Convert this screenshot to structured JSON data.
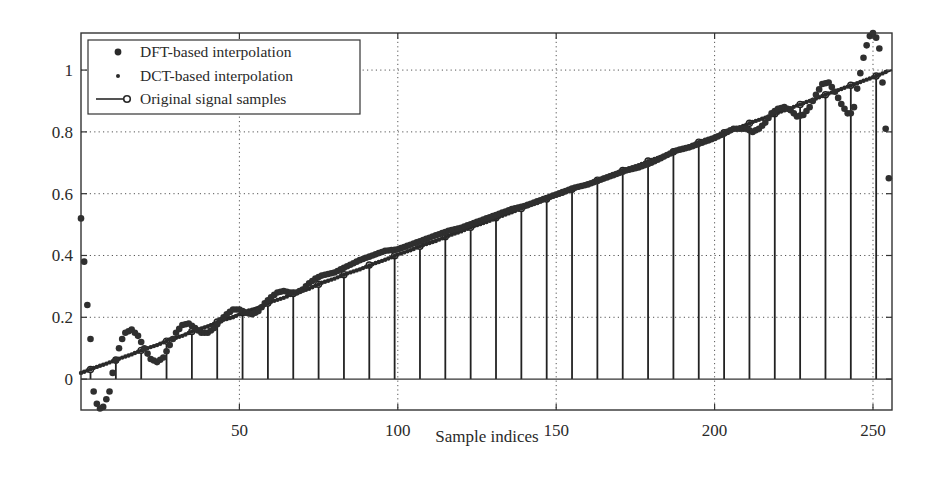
{
  "chart_data": {
    "type": "line",
    "title": "",
    "xlabel": "Sample indices",
    "ylabel": "",
    "xlim": [
      0,
      256
    ],
    "ylim": [
      -0.1,
      1.12
    ],
    "grid": true,
    "legend_position": "upper left",
    "x_ticks": [
      50,
      100,
      150,
      200,
      250
    ],
    "y_ticks": [
      0,
      0.2,
      0.4,
      0.6,
      0.8,
      1
    ],
    "y_tick_labels": [
      "0",
      "0.2",
      "0.4",
      "0.6",
      "0.8",
      "1"
    ],
    "x_tick_labels": [
      "50",
      "100",
      "150",
      "200",
      "250"
    ],
    "legend": [
      {
        "label": "DFT-based interpolation",
        "marker": "large-dot"
      },
      {
        "label": "DCT-based interpolation",
        "marker": "small-dot"
      },
      {
        "label": "Original signal samples",
        "marker": "stem-circle"
      }
    ],
    "series": [
      {
        "name": "Original signal samples",
        "style": "stem",
        "x": [
          3,
          11,
          19,
          27,
          35,
          43,
          51,
          59,
          67,
          75,
          83,
          91,
          99,
          107,
          115,
          123,
          131,
          139,
          147,
          155,
          163,
          171,
          179,
          187,
          195,
          203,
          211,
          219,
          227,
          235,
          243,
          251
        ],
        "values": [
          0.031,
          0.062,
          0.093,
          0.123,
          0.154,
          0.185,
          0.215,
          0.246,
          0.277,
          0.307,
          0.338,
          0.369,
          0.399,
          0.43,
          0.461,
          0.491,
          0.522,
          0.552,
          0.583,
          0.614,
          0.644,
          0.675,
          0.706,
          0.736,
          0.767,
          0.797,
          0.828,
          0.859,
          0.889,
          0.92,
          0.951,
          0.981
        ]
      },
      {
        "name": "DFT-based interpolation",
        "style": "large-dot",
        "x": [
          0,
          1,
          2,
          3,
          4,
          5,
          6,
          7,
          8,
          9,
          10,
          11,
          12,
          13,
          14,
          16,
          18,
          20,
          22,
          24,
          26,
          28,
          30,
          32,
          34,
          36,
          38,
          40,
          42,
          44,
          46,
          48,
          50,
          52,
          54,
          56,
          58,
          60,
          62,
          64,
          66,
          68,
          70,
          72,
          74,
          76,
          78,
          80,
          84,
          88,
          92,
          96,
          100,
          104,
          108,
          112,
          116,
          120,
          124,
          128,
          132,
          136,
          140,
          144,
          148,
          152,
          156,
          160,
          164,
          168,
          172,
          176,
          180,
          184,
          188,
          192,
          196,
          200,
          204,
          206,
          208,
          210,
          212,
          214,
          216,
          218,
          220,
          222,
          224,
          226,
          228,
          230,
          232,
          234,
          236,
          238,
          240,
          242,
          243,
          244,
          245,
          246,
          247,
          248,
          249,
          250,
          251,
          252,
          253,
          254,
          255
        ],
        "values": [
          0.52,
          0.38,
          0.24,
          0.13,
          -0.04,
          -0.08,
          -0.095,
          -0.09,
          -0.065,
          -0.04,
          0.02,
          0.06,
          0.1,
          0.13,
          0.15,
          0.16,
          0.14,
          0.1,
          0.065,
          0.055,
          0.07,
          0.11,
          0.15,
          0.175,
          0.18,
          0.165,
          0.15,
          0.15,
          0.165,
          0.19,
          0.21,
          0.225,
          0.225,
          0.215,
          0.21,
          0.22,
          0.245,
          0.265,
          0.28,
          0.285,
          0.28,
          0.28,
          0.29,
          0.31,
          0.325,
          0.335,
          0.34,
          0.345,
          0.365,
          0.385,
          0.4,
          0.415,
          0.42,
          0.435,
          0.45,
          0.465,
          0.48,
          0.49,
          0.505,
          0.52,
          0.535,
          0.55,
          0.56,
          0.575,
          0.59,
          0.605,
          0.62,
          0.63,
          0.645,
          0.66,
          0.675,
          0.685,
          0.7,
          0.72,
          0.74,
          0.75,
          0.765,
          0.78,
          0.8,
          0.81,
          0.81,
          0.81,
          0.8,
          0.81,
          0.83,
          0.86,
          0.875,
          0.88,
          0.87,
          0.85,
          0.855,
          0.88,
          0.92,
          0.955,
          0.96,
          0.93,
          0.89,
          0.86,
          0.86,
          0.88,
          0.94,
          0.99,
          1.04,
          1.08,
          1.11,
          1.12,
          1.105,
          1.07,
          0.96,
          0.81,
          0.65
        ]
      },
      {
        "name": "DCT-based interpolation",
        "style": "small-dot",
        "x": [
          0,
          4,
          8,
          12,
          16,
          20,
          24,
          28,
          32,
          36,
          40,
          44,
          48,
          52,
          56,
          60,
          64,
          68,
          72,
          76,
          80,
          84,
          88,
          92,
          96,
          100,
          104,
          108,
          112,
          116,
          120,
          124,
          128,
          132,
          136,
          140,
          144,
          148,
          152,
          156,
          160,
          164,
          168,
          172,
          176,
          180,
          184,
          188,
          192,
          196,
          200,
          204,
          208,
          212,
          216,
          220,
          224,
          228,
          232,
          236,
          240,
          244,
          248,
          252,
          255
        ],
        "values": [
          0.02,
          0.036,
          0.05,
          0.066,
          0.08,
          0.097,
          0.11,
          0.128,
          0.14,
          0.158,
          0.17,
          0.189,
          0.2,
          0.219,
          0.23,
          0.25,
          0.263,
          0.281,
          0.292,
          0.312,
          0.325,
          0.342,
          0.355,
          0.372,
          0.386,
          0.403,
          0.417,
          0.434,
          0.447,
          0.464,
          0.478,
          0.495,
          0.508,
          0.525,
          0.54,
          0.556,
          0.57,
          0.587,
          0.6,
          0.617,
          0.63,
          0.648,
          0.663,
          0.679,
          0.692,
          0.709,
          0.722,
          0.74,
          0.754,
          0.771,
          0.785,
          0.8,
          0.815,
          0.832,
          0.846,
          0.862,
          0.877,
          0.893,
          0.908,
          0.924,
          0.939,
          0.954,
          0.969,
          0.985,
          0.998
        ]
      }
    ]
  }
}
